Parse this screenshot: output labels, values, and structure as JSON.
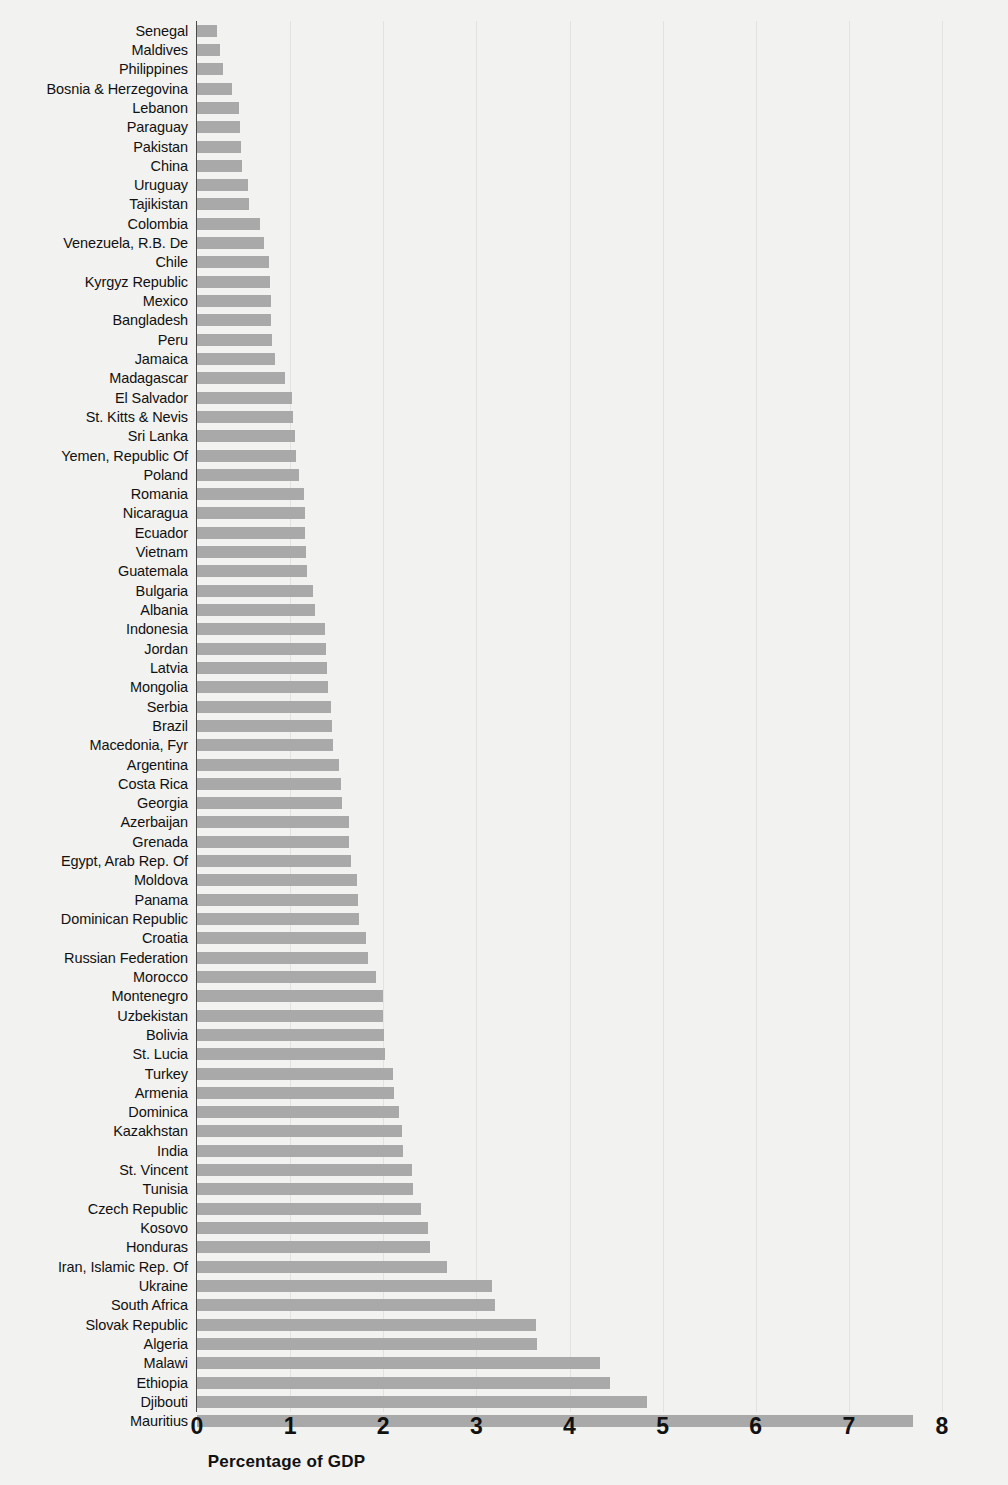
{
  "chart_data": {
    "type": "bar",
    "orientation": "horizontal",
    "title": "",
    "xlabel": "Percentage of GDP",
    "ylabel": "",
    "xlim": [
      0,
      8
    ],
    "xticks": [
      "0",
      "1",
      "2",
      "3",
      "4",
      "5",
      "6",
      "7",
      "8"
    ],
    "grid": true,
    "legend": null,
    "bar_color": "#a9a9a9",
    "background_color": "#f2f2f0",
    "categories": [
      "Senegal",
      "Maldives",
      "Philippines",
      "Bosnia & Herzegovina",
      "Lebanon",
      "Paraguay",
      "Pakistan",
      "China",
      "Uruguay",
      "Tajikistan",
      "Colombia",
      "Venezuela, R.B. De",
      "Chile",
      "Kyrgyz Republic",
      "Mexico",
      "Bangladesh",
      "Peru",
      "Jamaica",
      "Madagascar",
      "El Salvador",
      "St. Kitts & Nevis",
      "Sri Lanka",
      "Yemen, Republic Of",
      "Poland",
      "Romania",
      "Nicaragua",
      "Ecuador",
      "Vietnam",
      "Guatemala",
      "Bulgaria",
      "Albania",
      "Indonesia",
      "Jordan",
      "Latvia",
      "Mongolia",
      "Serbia",
      "Brazil",
      "Macedonia, Fyr",
      "Argentina",
      "Costa Rica",
      "Georgia",
      "Azerbaijan",
      "Grenada",
      "Egypt, Arab Rep. Of",
      "Moldova",
      "Panama",
      "Dominican Republic",
      "Croatia",
      "Russian Federation",
      "Morocco",
      "Montenegro",
      "Uzbekistan",
      "Bolivia",
      "St. Lucia",
      "Turkey",
      "Armenia",
      "Dominica",
      "Kazakhstan",
      "India",
      "St. Vincent",
      "Tunisia",
      "Czech Republic",
      "Kosovo",
      "Honduras",
      "Iran, Islamic Rep. Of",
      "Ukraine",
      "South Africa",
      "Slovak Republic",
      "Algeria",
      "Malawi",
      "Ethiopia",
      "Djibouti",
      "Mauritius"
    ],
    "values": [
      0.21,
      0.25,
      0.28,
      0.38,
      0.45,
      0.46,
      0.47,
      0.48,
      0.55,
      0.56,
      0.68,
      0.72,
      0.77,
      0.78,
      0.79,
      0.79,
      0.8,
      0.84,
      0.95,
      1.02,
      1.03,
      1.05,
      1.06,
      1.1,
      1.15,
      1.16,
      1.16,
      1.17,
      1.18,
      1.25,
      1.27,
      1.37,
      1.38,
      1.4,
      1.41,
      1.44,
      1.45,
      1.46,
      1.53,
      1.55,
      1.56,
      1.63,
      1.63,
      1.65,
      1.72,
      1.73,
      1.74,
      1.82,
      1.84,
      1.92,
      2.0,
      2.0,
      2.01,
      2.02,
      2.11,
      2.12,
      2.17,
      2.2,
      2.21,
      2.31,
      2.32,
      2.41,
      2.48,
      2.5,
      2.68,
      3.17,
      3.2,
      3.64,
      3.65,
      4.33,
      4.43,
      4.83,
      7.69
    ]
  }
}
